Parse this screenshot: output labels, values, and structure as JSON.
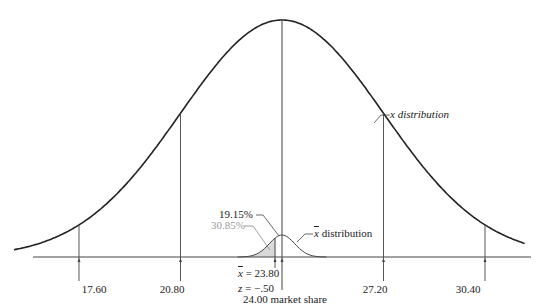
{
  "chart_data": {
    "type": "area",
    "title": "",
    "xlabel": "24.00 market share",
    "ylabel": "",
    "grid": false,
    "series": [
      {
        "name": "x distribution",
        "mean": 24.0,
        "std": 3.2,
        "color": "#222222"
      },
      {
        "name": "x̄ distribution",
        "mean": 24.0,
        "std": 0.4,
        "color": "#555555"
      }
    ],
    "ticks": [
      {
        "value": 17.6,
        "label": "17.60"
      },
      {
        "value": 20.8,
        "label": "20.80"
      },
      {
        "value": 27.2,
        "label": "27.20"
      },
      {
        "value": 30.4,
        "label": "30.40"
      }
    ],
    "annotations": [
      {
        "text": "x distribution",
        "target": "x distribution curve"
      },
      {
        "text": "x̄ distribution",
        "target": "sampling distribution curve"
      },
      {
        "text": "19.15%",
        "color": "#222222",
        "region": "between 23.80 and 24.00"
      },
      {
        "text": "30.85%",
        "color": "#9a9a9a",
        "region": "below 23.80 (shaded)"
      },
      {
        "text": "x̄ = 23.80",
        "position": 23.8
      },
      {
        "text": "z = −.50"
      },
      {
        "text": "24.00 market share",
        "position": 24.0
      }
    ],
    "xlim": [
      15.5,
      32.5
    ]
  },
  "labels": {
    "x_dist": "x distribution",
    "xbar_dist": " distribution",
    "xbar_sym": "x",
    "pct_1915": "19.15%",
    "pct_3085": "30.85%",
    "xbar_eq": " = 23.80",
    "z_sym": "z",
    "z_eq": " = −.50",
    "mean_label": "24.00 market share",
    "t1": "17.60",
    "t2": "20.80",
    "t3": "27.20",
    "t4": "30.40"
  }
}
